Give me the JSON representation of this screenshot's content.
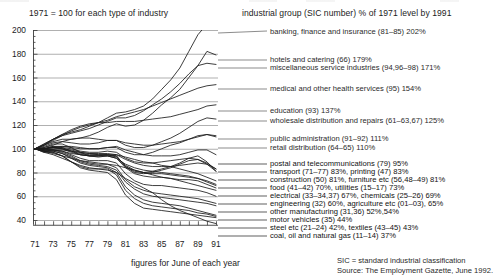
{
  "header": {
    "left": "1971 = 100 for each type of industry",
    "right": "industrial group (SIC number) % of 1971 level by 1991"
  },
  "axes": {
    "x_caption": "figures for June of each year",
    "y_ticks": [
      "200",
      "180",
      "160",
      "140",
      "120",
      "100",
      "80",
      "60",
      "40"
    ],
    "x_ticks": [
      "71",
      "73",
      "75",
      "77",
      "79",
      "81",
      "83",
      "85",
      "87",
      "89",
      "91"
    ]
  },
  "notes": {
    "sic": "SIC = standard industrial classification",
    "source": "Source: The Employment Gazette, June 1992."
  },
  "legend": [
    {
      "text": "banking, finance and insurance (81–85) 202%"
    },
    {
      "text": "hotels and catering (66) 179%"
    },
    {
      "text": "miscellaneous service industries (94,96–98) 171%"
    },
    {
      "text": "medical and other health services (95) 154%"
    },
    {
      "text": "education (93) 137%"
    },
    {
      "text": "wholesale distribution and repairs (61–63,67) 125%"
    },
    {
      "text": "public administration (91–92) 111%"
    },
    {
      "text": "retail distribution (64–65) 110%"
    },
    {
      "text": "postal and telecommunications (79) 95%"
    },
    {
      "text": "transport (71–77) 83%, printing (47) 83%"
    },
    {
      "text": "construction (50) 81%, furniture etc (56,48–49) 81%"
    },
    {
      "text": "food (41–42) 70%, utilities (15–17) 73%"
    },
    {
      "text": "electrical (33–34,37) 67%, chemicals (25–26) 69%"
    },
    {
      "text": "engineering (32) 60%, agriculture etc (01–03), 65%"
    },
    {
      "text": "other manufacturing (31,36) 52%,54%"
    },
    {
      "text": "motor vehicles (35) 44%"
    },
    {
      "text": "steel etc (21–24) 42%, textiles (43–45) 43%"
    },
    {
      "text": "coal, oil and natural gas (11–14) 37%"
    }
  ],
  "chart_data": {
    "type": "line",
    "title": "1971 = 100 for each type of industry",
    "xlabel": "figures for June of each year",
    "ylabel": "index (1971 = 100)",
    "xlim": [
      1971,
      1991
    ],
    "ylim": [
      30,
      205
    ],
    "yticks": [
      40,
      60,
      80,
      100,
      120,
      140,
      160,
      180,
      200
    ],
    "xticks": [
      1971,
      1973,
      1975,
      1977,
      1979,
      1981,
      1983,
      1985,
      1987,
      1989,
      1991
    ],
    "grid": "horizontal",
    "legend_position": "right",
    "x": [
      1971,
      1972,
      1973,
      1974,
      1975,
      1976,
      1977,
      1978,
      1979,
      1980,
      1981,
      1982,
      1983,
      1984,
      1985,
      1986,
      1987,
      1988,
      1989,
      1990,
      1991
    ],
    "series": [
      {
        "name": "banking, finance and insurance (81-85)",
        "final_pct": 202,
        "values": [
          100,
          103,
          108,
          112,
          114,
          116,
          119,
          122,
          126,
          130,
          131,
          133,
          136,
          142,
          150,
          158,
          168,
          182,
          196,
          205,
          202
        ]
      },
      {
        "name": "hotels and catering (66)",
        "final_pct": 179,
        "values": [
          100,
          103,
          106,
          108,
          108,
          109,
          111,
          114,
          118,
          121,
          119,
          120,
          124,
          130,
          137,
          143,
          150,
          160,
          170,
          182,
          179
        ]
      },
      {
        "name": "miscellaneous service industries (94,96-98)",
        "final_pct": 171,
        "values": [
          100,
          104,
          108,
          111,
          113,
          115,
          117,
          120,
          123,
          126,
          126,
          128,
          132,
          137,
          142,
          148,
          155,
          163,
          170,
          172,
          171
        ]
      },
      {
        "name": "medical and other health services (95)",
        "final_pct": 154,
        "values": [
          100,
          103,
          107,
          111,
          115,
          118,
          120,
          122,
          124,
          127,
          129,
          131,
          133,
          136,
          139,
          142,
          145,
          148,
          151,
          153,
          154
        ]
      },
      {
        "name": "education (93)",
        "final_pct": 137,
        "values": [
          100,
          104,
          108,
          112,
          116,
          119,
          121,
          122,
          122,
          123,
          123,
          123,
          124,
          125,
          126,
          127,
          129,
          131,
          133,
          136,
          137
        ]
      },
      {
        "name": "wholesale distribution and repairs (61-63,67)",
        "final_pct": 125,
        "values": [
          100,
          102,
          105,
          106,
          105,
          104,
          104,
          105,
          107,
          107,
          103,
          101,
          101,
          103,
          106,
          109,
          113,
          118,
          123,
          126,
          125
        ]
      },
      {
        "name": "public administration (91-92)",
        "final_pct": 111,
        "values": [
          100,
          101,
          103,
          106,
          108,
          109,
          109,
          108,
          107,
          107,
          105,
          104,
          103,
          103,
          104,
          105,
          106,
          108,
          110,
          112,
          111
        ]
      },
      {
        "name": "retail distribution (64-65)",
        "final_pct": 110,
        "values": [
          100,
          100,
          102,
          102,
          101,
          100,
          100,
          100,
          101,
          101,
          97,
          95,
          95,
          97,
          100,
          103,
          105,
          108,
          111,
          112,
          110
        ]
      },
      {
        "name": "postal and telecommunications (79)",
        "final_pct": 95,
        "values": [
          100,
          100,
          101,
          102,
          102,
          101,
          100,
          100,
          101,
          102,
          99,
          97,
          95,
          94,
          94,
          94,
          95,
          97,
          99,
          99,
          95
        ]
      },
      {
        "name": "transport (71-77)",
        "final_pct": 83,
        "values": [
          100,
          99,
          100,
          100,
          99,
          97,
          96,
          96,
          96,
          95,
          91,
          88,
          86,
          85,
          85,
          85,
          86,
          87,
          88,
          87,
          83
        ]
      },
      {
        "name": "printing (47)",
        "final_pct": 83,
        "values": [
          100,
          100,
          101,
          101,
          100,
          98,
          97,
          97,
          98,
          97,
          92,
          89,
          88,
          88,
          89,
          90,
          91,
          92,
          91,
          88,
          83
        ]
      },
      {
        "name": "construction (50)",
        "final_pct": 81,
        "values": [
          100,
          101,
          104,
          104,
          101,
          97,
          94,
          93,
          94,
          94,
          85,
          81,
          80,
          81,
          83,
          85,
          88,
          92,
          94,
          89,
          81
        ]
      },
      {
        "name": "furniture etc (56,48-49)",
        "final_pct": 81,
        "values": [
          100,
          100,
          102,
          101,
          98,
          95,
          94,
          94,
          95,
          94,
          85,
          80,
          79,
          80,
          82,
          84,
          87,
          90,
          91,
          87,
          81
        ]
      },
      {
        "name": "utilities (15-17)",
        "final_pct": 73,
        "values": [
          100,
          99,
          99,
          99,
          98,
          97,
          96,
          95,
          95,
          95,
          93,
          91,
          89,
          88,
          86,
          85,
          83,
          81,
          79,
          76,
          73
        ]
      },
      {
        "name": "food (41-42)",
        "final_pct": 70,
        "values": [
          100,
          99,
          99,
          98,
          96,
          95,
          94,
          94,
          94,
          92,
          87,
          84,
          82,
          81,
          80,
          79,
          78,
          77,
          75,
          73,
          70
        ]
      },
      {
        "name": "chemicals (25-26)",
        "final_pct": 69,
        "values": [
          100,
          100,
          101,
          100,
          98,
          96,
          95,
          95,
          95,
          93,
          86,
          82,
          80,
          79,
          79,
          78,
          77,
          76,
          75,
          72,
          69
        ]
      },
      {
        "name": "electrical (33-34,37)",
        "final_pct": 67,
        "values": [
          100,
          100,
          101,
          100,
          97,
          95,
          94,
          94,
          94,
          92,
          84,
          79,
          77,
          76,
          76,
          75,
          74,
          74,
          73,
          70,
          67
        ]
      },
      {
        "name": "agriculture etc (01-03)",
        "final_pct": 65,
        "values": [
          100,
          98,
          96,
          94,
          92,
          90,
          89,
          88,
          87,
          86,
          84,
          82,
          80,
          78,
          76,
          75,
          73,
          71,
          69,
          67,
          65
        ]
      },
      {
        "name": "engineering (32)",
        "final_pct": 60,
        "values": [
          100,
          98,
          99,
          98,
          95,
          92,
          90,
          90,
          90,
          88,
          79,
          73,
          70,
          69,
          69,
          68,
          67,
          66,
          65,
          63,
          60
        ]
      },
      {
        "name": "other manufacturing (31)",
        "final_pct": 54,
        "values": [
          100,
          99,
          99,
          97,
          94,
          90,
          88,
          87,
          87,
          84,
          74,
          68,
          65,
          63,
          62,
          61,
          60,
          59,
          58,
          56,
          54
        ]
      },
      {
        "name": "other manufacturing (36)",
        "final_pct": 52,
        "values": [
          100,
          98,
          98,
          96,
          93,
          89,
          87,
          86,
          85,
          82,
          72,
          66,
          62,
          60,
          59,
          58,
          57,
          56,
          55,
          54,
          52
        ]
      },
      {
        "name": "motor vehicles (35)",
        "final_pct": 44,
        "values": [
          100,
          98,
          98,
          96,
          92,
          88,
          86,
          85,
          84,
          80,
          68,
          61,
          57,
          55,
          54,
          53,
          52,
          50,
          48,
          46,
          44
        ]
      },
      {
        "name": "textiles (43-45)",
        "final_pct": 43,
        "values": [
          100,
          98,
          97,
          94,
          89,
          85,
          83,
          83,
          83,
          78,
          65,
          58,
          54,
          52,
          51,
          50,
          49,
          48,
          46,
          45,
          43
        ]
      },
      {
        "name": "steel etc (21-24)",
        "final_pct": 42,
        "values": [
          100,
          97,
          97,
          94,
          89,
          84,
          82,
          81,
          80,
          74,
          61,
          54,
          50,
          49,
          48,
          47,
          46,
          45,
          44,
          43,
          42
        ]
      },
      {
        "name": "coal, oil and natural gas (11-14)",
        "final_pct": 37,
        "values": [
          100,
          97,
          95,
          92,
          89,
          86,
          84,
          83,
          82,
          80,
          75,
          71,
          67,
          63,
          57,
          52,
          48,
          45,
          42,
          39,
          37
        ]
      }
    ]
  }
}
